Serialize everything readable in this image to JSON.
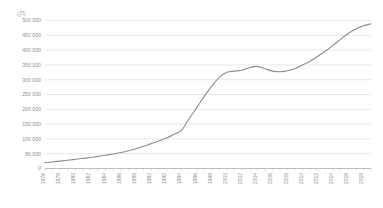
{
  "chart_data": {
    "type": "line",
    "title": "",
    "subtitle": "",
    "xlabel": "",
    "ylabel": "",
    "unit_label": "(戸)",
    "grid": true,
    "legend": false,
    "legend_position": "none",
    "line_color": "#8c8c8c",
    "axis_color": "#bdbdbd",
    "grid_color": "#d9d9d9",
    "tick_label_color": "#8f8f8f",
    "ylim": [
      0,
      500000
    ],
    "ytick_values": [
      0,
      50000,
      100000,
      150000,
      200000,
      250000,
      300000,
      350000,
      400000,
      450000,
      500000
    ],
    "ytick_labels": [
      "0",
      "50 000",
      "100 000",
      "150 000",
      "200 000",
      "250 000",
      "300 000",
      "350 000",
      "400 000",
      "450 000",
      "500 000"
    ],
    "xtick_labels": [
      "1976",
      "1978",
      "1980",
      "1982",
      "1984",
      "1986",
      "1988",
      "1990",
      "1992",
      "1994",
      "1996",
      "1998",
      "2000",
      "2002",
      "2004",
      "2006",
      "2008",
      "2010",
      "2012",
      "2014",
      "2016",
      "2018"
    ],
    "categories": [
      "1976",
      "1977",
      "1978",
      "1979",
      "1980",
      "1981",
      "1982",
      "1983",
      "1984",
      "1985",
      "1986",
      "1987",
      "1988",
      "1989",
      "1990",
      "1991",
      "1992",
      "1993",
      "1994",
      "1995",
      "1996",
      "1997",
      "1998",
      "1999",
      "2000",
      "2001",
      "2002",
      "2003",
      "2004",
      "2005",
      "2006",
      "2007",
      "2008",
      "2009",
      "2010",
      "2011",
      "2012",
      "2013",
      "2014",
      "2015",
      "2016",
      "2017",
      "2018",
      "2019"
    ],
    "values": [
      20000,
      22000,
      25000,
      28000,
      31000,
      34000,
      37000,
      41000,
      45000,
      49000,
      54000,
      60000,
      67000,
      75000,
      84000,
      93000,
      103000,
      115000,
      129000,
      168000,
      205000,
      243000,
      278000,
      308000,
      325000,
      329000,
      332000,
      341000,
      345000,
      337000,
      329000,
      327000,
      330000,
      338000,
      350000,
      363000,
      379000,
      397000,
      416000,
      437000,
      456000,
      471000,
      482000,
      489000
    ]
  }
}
